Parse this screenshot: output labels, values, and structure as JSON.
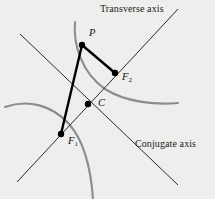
{
  "figure": {
    "background_color": "#eeeeec",
    "width": 215,
    "height": 199
  },
  "colors": {
    "background": "#eeeeec",
    "curve": "#8c8c8c",
    "asymptote": "#2b2b2b",
    "chord": "#000000",
    "point": "#000000",
    "text": "#1a1a1a"
  },
  "labels": {
    "transverse_axis": "Transverse axis",
    "conjugate_axis": "Conjugate axis",
    "point_P": "P",
    "point_F2_base": "F",
    "point_F2_sub": "2",
    "point_C": "C",
    "point_F1_base": "F",
    "point_F1_sub": "1"
  },
  "chart_data": {
    "type": "scatter",
    "xlabel": "Transverse axis",
    "ylabel": "Conjugate axis",
    "grid": false,
    "legend": null,
    "annotations": [
      "Transverse axis",
      "Conjugate axis",
      "P",
      "F2",
      "C",
      "F1"
    ],
    "points": [
      {
        "name": "P",
        "x": 82,
        "y": 45
      },
      {
        "name": "F2",
        "x": 115,
        "y": 73
      },
      {
        "name": "C",
        "x": 88,
        "y": 104
      },
      {
        "name": "F1",
        "x": 61,
        "y": 134
      }
    ],
    "lines": [
      {
        "name": "asymptote-ascending",
        "from": [
          17,
          182
        ],
        "to": [
          178,
          9
        ],
        "style": "thin-dark"
      },
      {
        "name": "asymptote-descending",
        "from": [
          20,
          34
        ],
        "to": [
          178,
          185
        ],
        "style": "thin-dark"
      },
      {
        "name": "focal-radius-P-F1",
        "from": [
          82,
          45
        ],
        "to": [
          61,
          134
        ],
        "style": "thick-black"
      },
      {
        "name": "focal-radius-P-F2",
        "from": [
          82,
          45
        ],
        "to": [
          115,
          73
        ],
        "style": "thick-black"
      }
    ],
    "curves": [
      {
        "name": "right-branch",
        "path": "M 75,22 C 73,45 82,73 105,89 C 125,102 155,105 178,103",
        "color": "#8c8c8c"
      },
      {
        "name": "left-branch",
        "path": "M 5,107 C 28,99 52,105 69,124 C 84,141 91,170 93,199",
        "color": "#8c8c8c"
      }
    ]
  }
}
